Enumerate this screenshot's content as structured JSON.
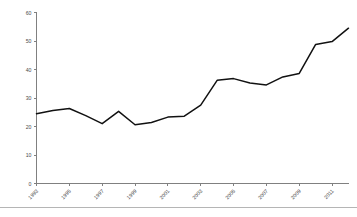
{
  "figure": {
    "background_color": "#ffffff",
    "line_color": "#111111",
    "axis_color": "#808080",
    "tick_label_color": "#4a4a4a",
    "footer_rule_color": "#b5b5b5"
  },
  "chart_data": {
    "type": "line",
    "title": "",
    "subtitle": "",
    "xlabel": "",
    "ylabel": "",
    "xlim": [
      1993,
      2012
    ],
    "ylim": [
      0,
      60
    ],
    "grid": false,
    "legend": false,
    "legend_position": "none",
    "x_tick_labels": [
      "1993",
      "1995",
      "1997",
      "1999",
      "2001",
      "2003",
      "2005",
      "2007",
      "2009",
      "2011"
    ],
    "x_tick_values": [
      1993,
      1995,
      1997,
      1999,
      2001,
      2003,
      2005,
      2007,
      2009,
      2011
    ],
    "x_tick_rotation": 45,
    "y_tick_labels": [
      "0",
      "10",
      "20",
      "30",
      "40",
      "50",
      "60"
    ],
    "y_tick_values": [
      0,
      10,
      20,
      30,
      40,
      50,
      60
    ],
    "x": [
      1993,
      1994,
      1995,
      1996,
      1997,
      1998,
      1999,
      2000,
      2001,
      2002,
      2003,
      2004,
      2005,
      2006,
      2007,
      2008,
      2009,
      2010,
      2011,
      2012
    ],
    "values": [
      24.5,
      25.6,
      26.3,
      23.8,
      21.0,
      25.3,
      20.6,
      21.4,
      23.3,
      23.6,
      27.5,
      36.2,
      36.8,
      35.3,
      34.6,
      37.4,
      38.6,
      48.8,
      49.8,
      54.5
    ],
    "series": [
      {
        "name": "series-1",
        "color": "#111111",
        "values": [
          24.5,
          25.6,
          26.3,
          23.8,
          21.0,
          25.3,
          20.6,
          21.4,
          23.3,
          23.6,
          27.5,
          36.2,
          36.8,
          35.3,
          34.6,
          37.4,
          38.6,
          48.8,
          49.8,
          54.5
        ]
      }
    ]
  }
}
